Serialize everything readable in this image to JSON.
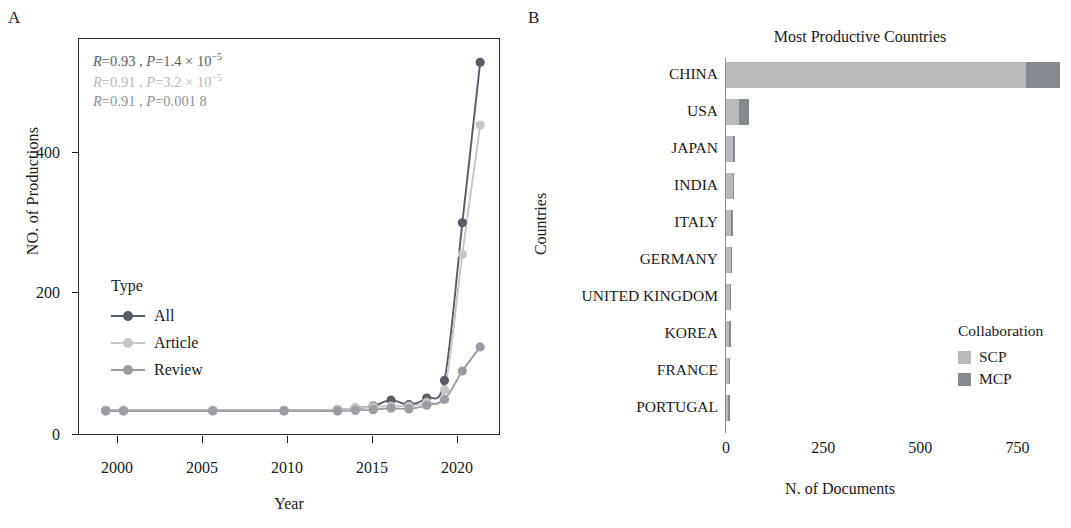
{
  "panels": {
    "a": {
      "label": "A"
    },
    "b": {
      "label": "B"
    }
  },
  "colors": {
    "all": "#585d63",
    "article": "#c2c6c9",
    "review": "#9a9ea2",
    "scp": "#b6babd",
    "mcp": "#848a8f",
    "axis": "#2a2a2a",
    "text": "#1a1a1a"
  },
  "panel_a": {
    "axis_title_y": "NO. of Productions",
    "axis_title_x": "Year",
    "annotations": [
      {
        "r_label": "R",
        "r_value": "=0.93 , ",
        "p_label": "P",
        "p_value": "=1.4 × 10",
        "exp": "−5",
        "color_key": "all"
      },
      {
        "r_label": "R",
        "r_value": "=0.91 , ",
        "p_label": "P",
        "p_value": "=3.2 × 10",
        "exp": "−5",
        "color_key": "article"
      },
      {
        "r_label": "R",
        "r_value": "=0.91 , ",
        "p_label": "P",
        "p_value": "=0.001 8",
        "exp": "",
        "color_key": "review"
      }
    ],
    "legend": {
      "title": "Type",
      "items": [
        {
          "label": "All",
          "color_key": "all"
        },
        {
          "label": "Article",
          "color_key": "article"
        },
        {
          "label": "Review",
          "color_key": "review"
        }
      ]
    }
  },
  "panel_b": {
    "title": "Most Productive Countries",
    "axis_title_y": "Countries",
    "axis_title_x": "N. of Documents",
    "legend": {
      "title": "Collaboration",
      "items": [
        {
          "label": "SCP",
          "color_key": "scp"
        },
        {
          "label": "MCP",
          "color_key": "mcp"
        }
      ]
    }
  },
  "chart_data": [
    {
      "type": "line",
      "panel": "A",
      "title": "",
      "xlabel": "Year",
      "ylabel": "NO. of Productions",
      "xlim": [
        1998.5,
        2022.0
      ],
      "ylim": [
        -30,
        510
      ],
      "xticks": [
        2000,
        2005,
        2010,
        2015,
        2020
      ],
      "yticks": [
        0,
        200,
        400
      ],
      "grid": false,
      "legend_title": "Type",
      "legend_position": "inside-left",
      "x": [
        2000,
        2001,
        2006,
        2010,
        2013,
        2014,
        2015,
        2016,
        2017,
        2018,
        2019,
        2020,
        2021
      ],
      "series": [
        {
          "name": "All",
          "color": "#585d63",
          "values": [
            1,
            1,
            1,
            1,
            2,
            4,
            7,
            15,
            9,
            18,
            42,
            258,
            478
          ]
        },
        {
          "name": "Article",
          "color": "#c2c6c9",
          "values": [
            1,
            1,
            1,
            1,
            2,
            4,
            6,
            7,
            7,
            12,
            29,
            215,
            392
          ]
        },
        {
          "name": "Review",
          "color": "#9a9ea2",
          "values": [
            0,
            0,
            0,
            0,
            0,
            1,
            2,
            4,
            3,
            8,
            16,
            55,
            88
          ]
        }
      ],
      "annotations": [
        "R=0.93 , P=1.4 × 10⁻⁵",
        "R=0.91 , P=3.2 × 10⁻⁵",
        "R=0.91 , P=0.001 8"
      ]
    },
    {
      "type": "bar",
      "panel": "B",
      "orientation": "horizontal",
      "stacked": true,
      "title": "Most Productive Countries",
      "xlabel": "N. of Documents",
      "ylabel": "Countries",
      "xlim": [
        0,
        880
      ],
      "xticks": [
        0,
        250,
        500,
        750
      ],
      "grid": false,
      "legend_title": "Collaboration",
      "legend_position": "inside-right",
      "categories": [
        "CHINA",
        "USA",
        "JAPAN",
        "INDIA",
        "ITALY",
        "GERMANY",
        "UNITED KINGDOM",
        "KOREA",
        "FRANCE",
        "PORTUGAL"
      ],
      "series": [
        {
          "name": "SCP",
          "color": "#b6babd",
          "values": [
            772,
            33,
            19,
            17,
            14,
            12,
            10,
            8,
            7,
            6
          ]
        },
        {
          "name": "MCP",
          "color": "#848a8f",
          "values": [
            88,
            25,
            5,
            4,
            5,
            4,
            4,
            3,
            3,
            3
          ]
        }
      ],
      "totals": [
        860,
        58,
        24,
        21,
        19,
        16,
        14,
        11,
        10,
        9
      ]
    }
  ]
}
